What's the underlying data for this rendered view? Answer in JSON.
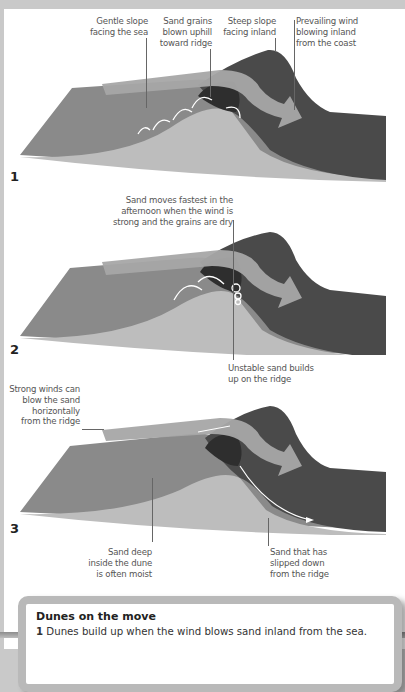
{
  "diagrams": [
    {
      "number": "1",
      "labels": [
        {
          "id": "gentle-slope",
          "text": "Gentle slope\nfacing the sea"
        },
        {
          "id": "sand-grains-blown",
          "text": "Sand grains\nblown uphill\ntoward ridge"
        },
        {
          "id": "steep-slope",
          "text": "Steep slope\nfacing inland"
        },
        {
          "id": "prevailing-wind",
          "text": "Prevailing wind\nblowing inland\nfrom the coast"
        }
      ]
    },
    {
      "number": "2",
      "labels": [
        {
          "id": "sand-moves-fastest",
          "text": "Sand moves fastest in the\nafternoon when the wind is\nstrong and the grains are dry"
        },
        {
          "id": "unstable-sand",
          "text": "Unstable sand builds\nup on the ridge"
        }
      ]
    },
    {
      "number": "3",
      "labels": [
        {
          "id": "strong-winds",
          "text": "Strong winds can\nblow the sand\nhorizontally\nfrom the ridge"
        },
        {
          "id": "sand-deep-inside",
          "text": "Sand deep\ninside the dune\nis often moist"
        },
        {
          "id": "sand-slipped-down",
          "text": "Sand that has\nslipped down\nfrom the ridge"
        }
      ]
    }
  ],
  "infobox": {
    "title": "Dunes on the move",
    "items": [
      {
        "number": "1",
        "text": " Dunes build up when the wind blows sand inland from the sea."
      }
    ]
  },
  "colors": {
    "page_border": "#c9c9c9",
    "dune_seaward_face": "#8a8a8a",
    "dune_inland_face": "#4a4a4a",
    "dune_crest": "#2e2e2e",
    "sand_interior": "#bdbdbd",
    "wind_arrow": "#a6a6a6",
    "infobox_border": "#b9b9b9"
  }
}
